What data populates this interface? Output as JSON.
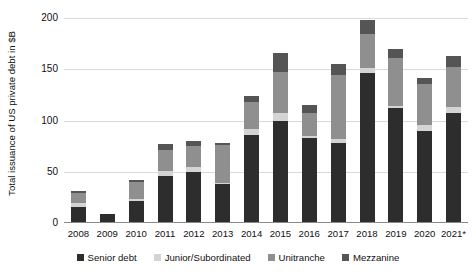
{
  "chart_data": {
    "type": "bar",
    "stacked": true,
    "title": "",
    "xlabel": "",
    "ylabel": "Total issuance of US private debt in $B",
    "ylim": [
      0,
      200
    ],
    "yticks": [
      0,
      50,
      100,
      150,
      200
    ],
    "grid": true,
    "legend_position": "bottom",
    "categories": [
      "2008",
      "2009",
      "2010",
      "2011",
      "2012",
      "2013",
      "2014",
      "2015",
      "2016",
      "2017",
      "2018",
      "2019",
      "2020",
      "2021*"
    ],
    "series": [
      {
        "name": "Senior debt",
        "color": "#2d2d2d",
        "values": [
          16,
          9,
          21,
          46,
          50,
          38,
          86,
          100,
          83,
          78,
          146,
          112,
          90,
          107
        ]
      },
      {
        "name": "Junior/Subordinated",
        "color": "#d4d4d4",
        "values": [
          4,
          0,
          2,
          5,
          5,
          1,
          6,
          7,
          2,
          4,
          5,
          2,
          6,
          6
        ]
      },
      {
        "name": "Unitranche",
        "color": "#8f8f8f",
        "values": [
          9,
          0,
          17,
          20,
          20,
          37,
          26,
          40,
          22,
          62,
          33,
          47,
          40,
          39
        ]
      },
      {
        "name": "Mezzanine",
        "color": "#555555",
        "values": [
          2,
          0,
          2,
          6,
          5,
          2,
          6,
          19,
          8,
          11,
          14,
          9,
          5,
          11
        ]
      }
    ],
    "totals": [
      31,
      9,
      42,
      77,
      80,
      78,
      124,
      166,
      115,
      155,
      198,
      170,
      141,
      163
    ]
  },
  "legend": {
    "items": [
      {
        "label": "Senior debt"
      },
      {
        "label": "Junior/Subordinated"
      },
      {
        "label": "Unitranche"
      },
      {
        "label": "Mezzanine"
      }
    ]
  },
  "axes": {
    "y_title": "Total issuance of US private debt in $B",
    "y_ticks": [
      "0",
      "50",
      "100",
      "150",
      "200"
    ],
    "x_ticks": [
      "2008",
      "2009",
      "2010",
      "2011",
      "2012",
      "2013",
      "2014",
      "2015",
      "2016",
      "2017",
      "2018",
      "2019",
      "2020",
      "2021*"
    ]
  },
  "clipped_header": ""
}
